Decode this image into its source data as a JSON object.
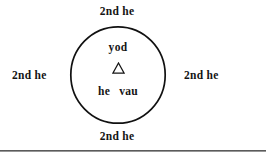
{
  "figure": {
    "type": "diagram",
    "background_color": "#ffffff",
    "ink_color": "#141414",
    "circle": {
      "stroke_color": "#111111",
      "center_x": 118,
      "center_y": 75,
      "diameter": 96
    },
    "outer_labels": {
      "top": "2nd he",
      "right": "2nd he",
      "bottom": "2nd he",
      "left": "2nd he"
    },
    "inner_labels": {
      "top": "yod",
      "middle_symbol": "Δ",
      "middle_symbol_name": "triangle",
      "bottom_left": "he",
      "bottom_right": "vau"
    },
    "rule": {
      "present": true,
      "color": "#5a5a5a"
    }
  }
}
